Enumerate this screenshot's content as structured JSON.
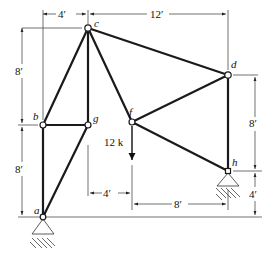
{
  "diagram": {
    "type": "planar-truss",
    "nodes": [
      {
        "id": "a",
        "label": "a",
        "x": 43,
        "y": 217,
        "support": "pin"
      },
      {
        "id": "b",
        "label": "b",
        "x": 43,
        "y": 125
      },
      {
        "id": "c",
        "label": "c",
        "x": 88,
        "y": 28
      },
      {
        "id": "d",
        "label": "d",
        "x": 228,
        "y": 75
      },
      {
        "id": "f",
        "label": "f",
        "x": 132,
        "y": 122
      },
      {
        "id": "g",
        "label": "g",
        "x": 88,
        "y": 125
      },
      {
        "id": "h",
        "label": "h",
        "x": 228,
        "y": 171,
        "support": "pin"
      }
    ],
    "members": [
      [
        "a",
        "b"
      ],
      [
        "b",
        "c"
      ],
      [
        "b",
        "g"
      ],
      [
        "a",
        "g"
      ],
      [
        "c",
        "g"
      ],
      [
        "c",
        "f"
      ],
      [
        "c",
        "d"
      ],
      [
        "f",
        "d"
      ],
      [
        "f",
        "h"
      ],
      [
        "d",
        "h"
      ]
    ],
    "load": {
      "node": "f",
      "label": "12 k",
      "direction": "down"
    },
    "dimensions": {
      "top_left": "4′",
      "top_right": "12′",
      "left_upper": "8′",
      "left_lower": "8′",
      "right_upper": "8′",
      "right_lower": "4′",
      "bottom_left": "4′",
      "bottom_right": "8′"
    }
  }
}
